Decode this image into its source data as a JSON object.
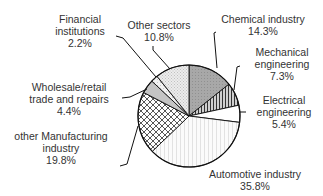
{
  "chart_data": {
    "type": "pie",
    "title": "",
    "start_angle_deg": 0,
    "direction": "clockwise",
    "center": [
      189,
      116
    ],
    "radius": 51,
    "slices": [
      {
        "label": "Chemical industry",
        "lines": [
          "Chemical industry",
          "14.3%"
        ],
        "value": 14.3,
        "pattern": "gray",
        "label_pos": [
          263,
          13
        ],
        "leader": [
          [
            217,
            68
          ],
          [
            214,
            33
          ],
          [
            216,
            32
          ]
        ]
      },
      {
        "label": "Mechanical engineering",
        "lines": [
          "Mechanical",
          "engineering",
          "7.3%"
        ],
        "value": 7.3,
        "pattern": "vlines",
        "label_pos": [
          282,
          46
        ],
        "leader": [
          [
            234,
            90
          ],
          [
            237,
            67
          ],
          [
            240,
            66
          ]
        ]
      },
      {
        "label": "Electrical engineering",
        "lines": [
          "Electrical",
          "engineering",
          "5.4%"
        ],
        "value": 5.4,
        "pattern": "white",
        "label_pos": [
          284,
          94
        ],
        "leader": [
          [
            240,
            112
          ],
          [
            246,
            112
          ]
        ]
      },
      {
        "label": "Automotive industry",
        "lines": [
          "Automotive industry",
          "35.8%"
        ],
        "value": 35.8,
        "pattern": "fine-vlines",
        "label_pos": [
          255,
          168
        ],
        "leader": []
      },
      {
        "label": "other Manufacturing industry",
        "lines": [
          "other Manufacturing",
          "industry",
          "19.8%"
        ],
        "value": 19.8,
        "pattern": "crosshatch",
        "label_pos": [
          61,
          130
        ],
        "leader": [
          [
            138,
            126
          ],
          [
            127,
            164
          ],
          [
            120,
            166
          ]
        ]
      },
      {
        "label": "Wholesale/retail trade and repairs",
        "lines": [
          "Wholesale/retail",
          "trade and repairs",
          "4.4%"
        ],
        "value": 4.4,
        "pattern": "light-gray",
        "label_pos": [
          69,
          81
        ],
        "leader": [
          [
            147,
            89
          ],
          [
            130,
            97
          ],
          [
            122,
            98
          ]
        ]
      },
      {
        "label": "Financial institutions",
        "lines": [
          "Financial",
          "institutions",
          "2.2%"
        ],
        "value": 2.2,
        "pattern": "dots-light",
        "label_pos": [
          80,
          13
        ],
        "leader": [
          [
            156,
            77
          ],
          [
            123,
            38
          ],
          [
            116,
            36
          ]
        ]
      },
      {
        "label": "Other sectors",
        "lines": [
          "Other sectors",
          "10.8%"
        ],
        "value": 10.8,
        "pattern": "dots",
        "label_pos": [
          159,
          19
        ],
        "leader": [
          [
            170,
            69
          ],
          [
            153,
            50
          ],
          [
            153,
            46
          ]
        ]
      }
    ],
    "legend": null
  }
}
